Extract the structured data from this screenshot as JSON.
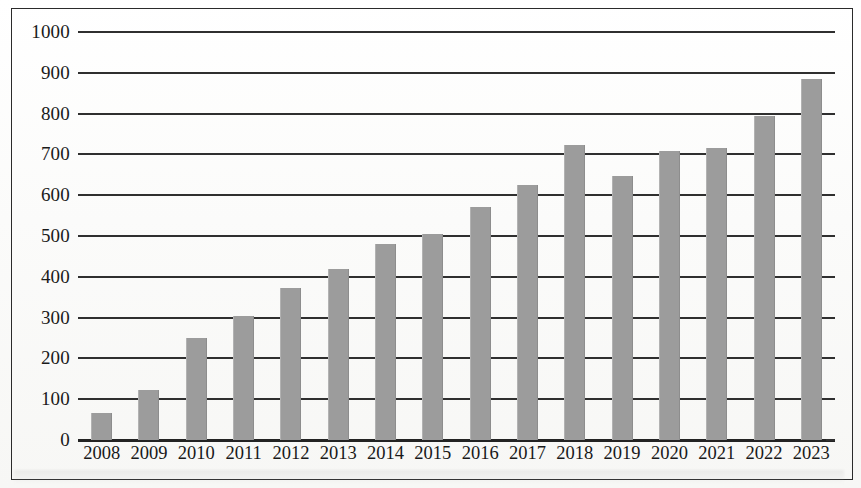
{
  "chart_data": {
    "type": "bar",
    "title": "",
    "subtitle": "",
    "xlabel": "",
    "ylabel": "",
    "categories": [
      "2008",
      "2009",
      "2010",
      "2011",
      "2012",
      "2013",
      "2014",
      "2015",
      "2016",
      "2017",
      "2018",
      "2019",
      "2020",
      "2021",
      "2022",
      "2023"
    ],
    "values": [
      65,
      122,
      250,
      303,
      372,
      420,
      480,
      505,
      570,
      625,
      722,
      647,
      708,
      715,
      795,
      885
    ],
    "series": [
      {
        "name": "",
        "values": [
          65,
          122,
          250,
          303,
          372,
          420,
          480,
          505,
          570,
          625,
          722,
          647,
          708,
          715,
          795,
          885
        ]
      }
    ],
    "ylim": [
      0,
      1000
    ],
    "ytick_labels": [
      "0",
      "100",
      "200",
      "300",
      "400",
      "500",
      "600",
      "700",
      "800",
      "900",
      "1000"
    ],
    "ytick_values": [
      0,
      100,
      200,
      300,
      400,
      500,
      600,
      700,
      800,
      900,
      1000
    ],
    "ytick_step": 100,
    "grid": true,
    "grid_axis": "y",
    "legend": false,
    "legend_position": "none",
    "bar_color": "#9c9c9c",
    "grid_color": "#2f2f2f",
    "axis_color": "#232323",
    "text_color": "#1a1a1a",
    "background_color": "#fdfdfc",
    "frame": true,
    "annotations": []
  }
}
